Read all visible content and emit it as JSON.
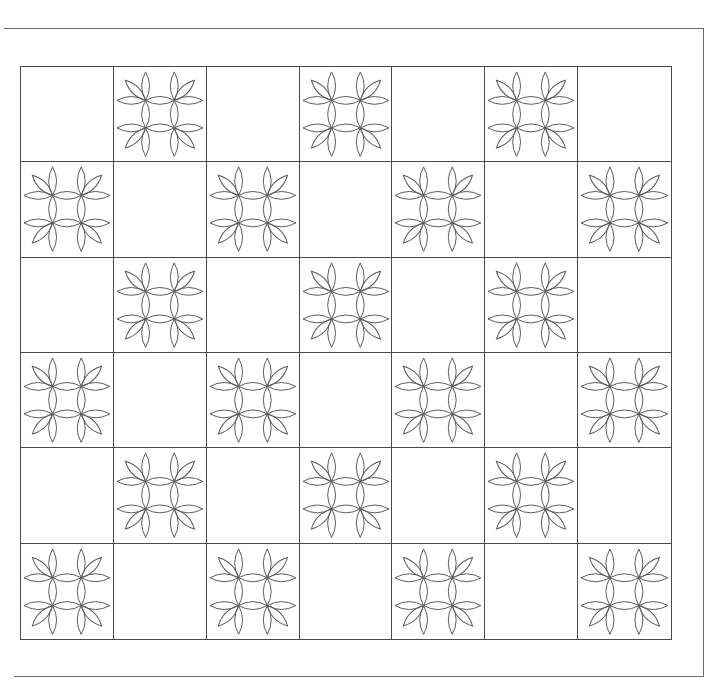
{
  "pattern": {
    "type": "quilt-block-layout",
    "columns": 7,
    "rows": 6,
    "layout": "checkerboard alternating plain and petal-motif blocks",
    "first_cell": "plain",
    "motif": {
      "name": "four-flower petal motif",
      "flowers_per_block": 4,
      "petals_per_flower": 3,
      "description": "2x2 arrangement of flower centers joined by shared oval petals"
    },
    "colors": {
      "line": "#4a4a4a",
      "petal_stroke": "#5a5a5a",
      "background": "#ffffff"
    }
  }
}
